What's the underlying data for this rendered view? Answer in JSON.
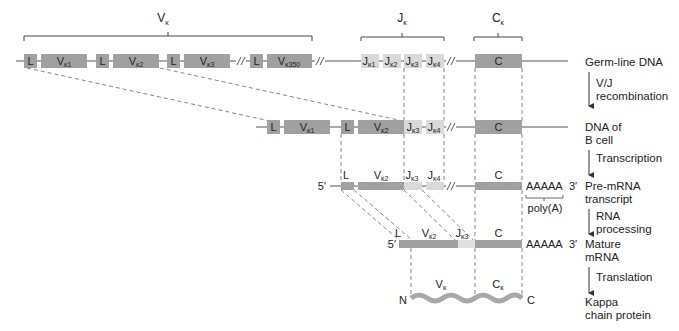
{
  "colors": {
    "gene_segment": "#a0a0a0",
    "j_segment": "#d9d9d9",
    "mature_j": "#e0e0e0",
    "protein": "#a8a8a8",
    "line": "#555555",
    "text": "#222222"
  },
  "headers": {
    "v_region": {
      "main": "V",
      "sub": "κ"
    },
    "j_region": {
      "main": "J",
      "sub": "κ"
    },
    "c_region": {
      "main": "C",
      "sub": "κ"
    }
  },
  "germline": {
    "segments": [
      {
        "label": "L"
      },
      {
        "main": "V",
        "sub": "κ1"
      },
      {
        "label": "L"
      },
      {
        "main": "V",
        "sub": "κ2"
      },
      {
        "label": "L"
      },
      {
        "main": "V",
        "sub": "κ3"
      },
      {
        "label": "L"
      },
      {
        "main": "V",
        "sub": "κ350"
      },
      {
        "main": "J",
        "sub": "κ1"
      },
      {
        "main": "J",
        "sub": "κ2"
      },
      {
        "main": "J",
        "sub": "κ3"
      },
      {
        "main": "J",
        "sub": "κ4"
      },
      {
        "label": "C"
      }
    ]
  },
  "bcell": {
    "segments": [
      {
        "label": "L"
      },
      {
        "main": "V",
        "sub": "κ1"
      },
      {
        "label": "L"
      },
      {
        "main": "V",
        "sub": "κ2"
      },
      {
        "main": "J",
        "sub": "κ3"
      },
      {
        "main": "J",
        "sub": "κ4"
      },
      {
        "label": "C"
      }
    ]
  },
  "premrna": {
    "five_prime": "5′",
    "three_prime": "3′",
    "polyA_seq": "AAAAA",
    "polyA_label": "poly(A)",
    "segments": [
      {
        "label": "L"
      },
      {
        "main": "V",
        "sub": "κ2"
      },
      {
        "main": "J",
        "sub": "κ3"
      },
      {
        "main": "J",
        "sub": "κ4"
      },
      {
        "label": "C"
      }
    ]
  },
  "mature": {
    "five_prime": "5′",
    "three_prime": "3′",
    "polyA_seq": "AAAAA",
    "segments": [
      {
        "label": "L"
      },
      {
        "main": "V",
        "sub": "κ2"
      },
      {
        "main": "J",
        "sub": "κ3"
      },
      {
        "label": "C"
      }
    ]
  },
  "protein": {
    "n_term": "N",
    "c_term": "C",
    "v_label": {
      "main": "V",
      "sub": "κ"
    },
    "c_label": {
      "main": "C",
      "sub": "κ"
    }
  },
  "side_labels": {
    "germline": "Germ-line DNA",
    "step1_a": "V/J",
    "step1_b": "recombination",
    "bcell_a": "DNA of",
    "bcell_b": "B cell",
    "step2": "Transcription",
    "premrna_a": "Pre-mRNA",
    "premrna_b": "transcript",
    "step3_a": "RNA",
    "step3_b": "processing",
    "mature_a": "Mature",
    "mature_b": "mRNA",
    "step4": "Translation",
    "protein_a": "Kappa",
    "protein_b": "chain protein"
  }
}
